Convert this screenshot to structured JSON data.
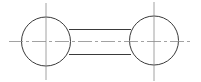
{
  "diagram": {
    "type": "technical-drawing",
    "colors": {
      "outline": "#3a3a3a",
      "centerline": "#8a8a8a",
      "background": "#ffffff"
    },
    "left_circle": {
      "cx": 46,
      "cy": 41.5,
      "r": 24.5
    },
    "right_circle": {
      "cx": 154,
      "cy": 40.5,
      "r": 24.5
    },
    "bar": {
      "x1": 70,
      "x2": 130,
      "top_y": 29,
      "bottom_y": 54
    },
    "horizontal_centerline": {
      "x1": 9,
      "x2": 192,
      "y": 41
    },
    "left_vertical_centerline": {
      "x": 46,
      "y1": 3,
      "y2": 80
    },
    "right_vertical_centerline": {
      "x": 154,
      "y1": 2,
      "y2": 81
    }
  }
}
